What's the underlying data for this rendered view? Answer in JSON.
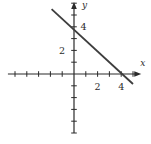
{
  "figure": {
    "background": "#ffffff",
    "axis_color": "#2b2b2b",
    "line_color": "#3d3d3d"
  },
  "chart_data": {
    "type": "line",
    "title": "",
    "xlabel": "x",
    "ylabel": "y",
    "xlim": [
      -5.6,
      5.7
    ],
    "ylim": [
      -5.0,
      6.1
    ],
    "tick_step": 1,
    "grid": false,
    "x_tick_labels": [
      {
        "value": 2,
        "text": "2"
      },
      {
        "value": 4,
        "text": "4"
      }
    ],
    "y_tick_labels": [
      {
        "value": 2,
        "text": "2",
        "side": "left"
      },
      {
        "value": 4,
        "text": "4",
        "side": "right"
      }
    ],
    "series": [
      {
        "name": "line",
        "equation": "y = -x + 4",
        "slope": -1,
        "y_intercept": 4,
        "x_intercept": 4,
        "segment_points": [
          [
            -1.9,
            5.5
          ],
          [
            5.0,
            -0.85
          ]
        ]
      }
    ]
  }
}
